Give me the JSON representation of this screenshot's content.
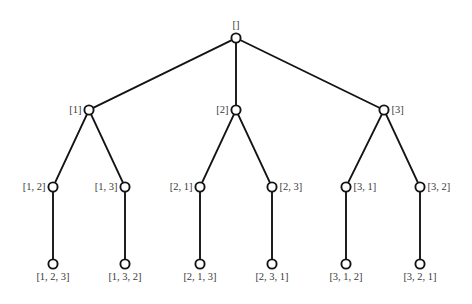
{
  "figure": {
    "name": "permutation-tree",
    "background_color": "#ffffff",
    "line_color": "#141414",
    "node_fill_color": "#ffffff",
    "label_color": "#3a3a3a",
    "node_radius": 4.6
  },
  "nodes": [
    {
      "id": "root",
      "label": "[]",
      "x": 236,
      "y": 38,
      "label_pos": "above",
      "level": 0
    },
    {
      "id": "n1",
      "label": "[1]",
      "x": 89,
      "y": 110,
      "label_pos": "left",
      "level": 1
    },
    {
      "id": "n2",
      "label": "[2]",
      "x": 236,
      "y": 110,
      "label_pos": "left",
      "level": 1
    },
    {
      "id": "n3",
      "label": "[3]",
      "x": 384,
      "y": 110,
      "label_pos": "right",
      "level": 1
    },
    {
      "id": "n12",
      "label": "[1, 2]",
      "x": 53,
      "y": 187,
      "label_pos": "left",
      "level": 2
    },
    {
      "id": "n13",
      "label": "[1, 3]",
      "x": 125,
      "y": 187,
      "label_pos": "left",
      "level": 2
    },
    {
      "id": "n21",
      "label": "[2, 1]",
      "x": 200,
      "y": 187,
      "label_pos": "left",
      "level": 2
    },
    {
      "id": "n23",
      "label": "[2, 3]",
      "x": 272,
      "y": 187,
      "label_pos": "right",
      "level": 2
    },
    {
      "id": "n31",
      "label": "[3, 1]",
      "x": 346,
      "y": 187,
      "label_pos": "right",
      "level": 2
    },
    {
      "id": "n32",
      "label": "[3, 2]",
      "x": 420,
      "y": 187,
      "label_pos": "right",
      "level": 2
    },
    {
      "id": "n123",
      "label": "[1, 2, 3]",
      "x": 53,
      "y": 264,
      "label_pos": "below",
      "level": 3
    },
    {
      "id": "n132",
      "label": "[1, 3, 2]",
      "x": 125,
      "y": 264,
      "label_pos": "below",
      "level": 3
    },
    {
      "id": "n213",
      "label": "[2, 1, 3]",
      "x": 200,
      "y": 264,
      "label_pos": "below",
      "level": 3
    },
    {
      "id": "n231",
      "label": "[2, 3, 1]",
      "x": 272,
      "y": 264,
      "label_pos": "below",
      "level": 3
    },
    {
      "id": "n312",
      "label": "[3, 1, 2]",
      "x": 346,
      "y": 264,
      "label_pos": "below",
      "level": 3
    },
    {
      "id": "n321",
      "label": "[3, 2, 1]",
      "x": 420,
      "y": 264,
      "label_pos": "below",
      "level": 3
    }
  ],
  "edges": [
    {
      "from": "root",
      "to": "n1"
    },
    {
      "from": "root",
      "to": "n2"
    },
    {
      "from": "root",
      "to": "n3"
    },
    {
      "from": "n1",
      "to": "n12"
    },
    {
      "from": "n1",
      "to": "n13"
    },
    {
      "from": "n2",
      "to": "n21"
    },
    {
      "from": "n2",
      "to": "n23"
    },
    {
      "from": "n3",
      "to": "n31"
    },
    {
      "from": "n3",
      "to": "n32"
    },
    {
      "from": "n12",
      "to": "n123"
    },
    {
      "from": "n13",
      "to": "n132"
    },
    {
      "from": "n21",
      "to": "n213"
    },
    {
      "from": "n23",
      "to": "n231"
    },
    {
      "from": "n31",
      "to": "n312"
    },
    {
      "from": "n32",
      "to": "n321"
    }
  ]
}
